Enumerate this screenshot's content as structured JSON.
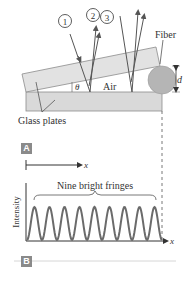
{
  "panel_a": {
    "tag": "A",
    "ray_labels": [
      "1",
      "2",
      "3"
    ],
    "fiber_label": "Fiber",
    "thickness_label": "d",
    "angle_label": "θ",
    "gap_label": "Air",
    "plates_label": "Glass plates"
  },
  "panel_b": {
    "tag": "B",
    "x_axis_label": "x",
    "y_axis_label": "Intensity",
    "annotation": "Nine bright fringes",
    "top_axis_label": "x"
  },
  "colors": {
    "glass": "#d9d9d9",
    "glass_edge": "#8c8c8c",
    "fiber": "#b5b5b5",
    "ray": "#555555",
    "curve": "#6b6b6b",
    "axis": "#333333"
  },
  "chart_data": {
    "type": "line",
    "title": "Nine bright fringes",
    "xlabel": "x",
    "ylabel": "Intensity",
    "fringe_count": 9,
    "x": [
      0,
      0.5,
      1,
      1.5,
      2,
      2.5,
      3,
      3.5,
      4,
      4.5,
      5,
      5.5,
      6,
      6.5,
      7,
      7.5,
      8,
      8.5,
      9
    ],
    "values": [
      0,
      1,
      0,
      1,
      0,
      1,
      0,
      1,
      0,
      1,
      0,
      1,
      0,
      1,
      0,
      1,
      0,
      1,
      0
    ],
    "grid": false
  }
}
